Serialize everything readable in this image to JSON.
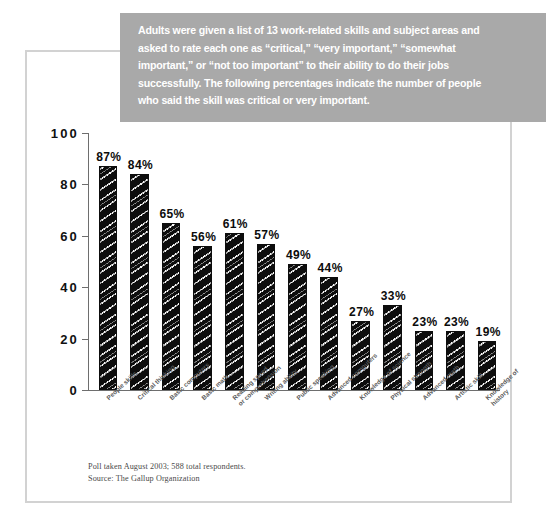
{
  "callout": {
    "lines": [
      "Adults were given a list of 13 work-related skills and subject areas and",
      "asked to rate each one as “critical,” “very important,” “somewhat",
      "important,” or “not too important” to their ability to do their jobs",
      "successfully.  The following percentages indicate the number of people",
      "who said the skill was critical or very important."
    ],
    "background_color": "#a9a9a9",
    "text_color": "#ffffff"
  },
  "footnote": {
    "line1": "Poll taken August 2003; 588 total respondents.",
    "line2": "Source: The Gallup Organization"
  },
  "chart_data": {
    "type": "bar",
    "title": "",
    "xlabel": "",
    "ylabel": "",
    "ylim": [
      0,
      100
    ],
    "yticks": [
      0,
      20,
      40,
      60,
      80,
      100
    ],
    "grid": false,
    "legend": "none",
    "bar_color": "#0d0d0d",
    "categories": [
      "People skills",
      "Critical thinking",
      "Basic computers",
      "Basic math",
      "Reading speed\nor comprehension",
      "Writing ability",
      "Public speaking",
      "Advanced computers",
      "Knowledge of science",
      "Physical strength",
      "Advanced math",
      "Artistic skill",
      "Knowledge of history"
    ],
    "values": [
      87,
      84,
      65,
      56,
      61,
      57,
      49,
      44,
      27,
      33,
      23,
      23,
      19
    ],
    "data_labels": [
      "87%",
      "84%",
      "65%",
      "56%",
      "61%",
      "57%",
      "49%",
      "44%",
      "27%",
      "33%",
      "23%",
      "23%",
      "19%"
    ]
  }
}
